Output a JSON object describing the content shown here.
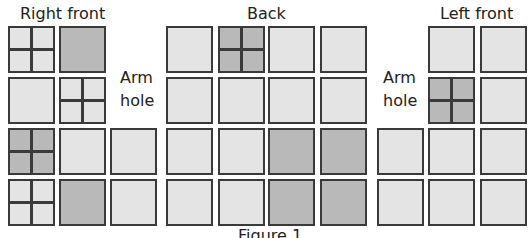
{
  "figure": {
    "caption": "Figure 1",
    "colors": {
      "light": "#e4e4e4",
      "dark": "#b9b9b9",
      "border": "#3a3a3a"
    }
  },
  "sections": {
    "right_front": {
      "title": "Right front"
    },
    "back": {
      "title": "Back"
    },
    "left_front": {
      "title": "Left front"
    }
  },
  "armhole_left": {
    "line1": "Arm",
    "line2": "hole"
  },
  "armhole_right": {
    "line1": "Arm",
    "line2": "hole"
  },
  "squares": [
    {
      "section": "right_front",
      "row": 1,
      "col": 1,
      "x": 8,
      "y": 26,
      "shade": "light",
      "quartered": true
    },
    {
      "section": "right_front",
      "row": 1,
      "col": 2,
      "x": 59,
      "y": 26,
      "shade": "dark",
      "quartered": false
    },
    {
      "section": "right_front",
      "row": 2,
      "col": 1,
      "x": 8,
      "y": 77,
      "shade": "light",
      "quartered": false
    },
    {
      "section": "right_front",
      "row": 2,
      "col": 2,
      "x": 59,
      "y": 77,
      "shade": "light",
      "quartered": true
    },
    {
      "section": "right_front",
      "row": 3,
      "col": 1,
      "x": 8,
      "y": 128,
      "shade": "dark",
      "quartered": true
    },
    {
      "section": "right_front",
      "row": 3,
      "col": 2,
      "x": 59,
      "y": 128,
      "shade": "light",
      "quartered": false
    },
    {
      "section": "right_front",
      "row": 3,
      "col": 3,
      "x": 110,
      "y": 128,
      "shade": "light",
      "quartered": false
    },
    {
      "section": "right_front",
      "row": 4,
      "col": 1,
      "x": 8,
      "y": 179,
      "shade": "light",
      "quartered": true
    },
    {
      "section": "right_front",
      "row": 4,
      "col": 2,
      "x": 59,
      "y": 179,
      "shade": "dark",
      "quartered": false
    },
    {
      "section": "right_front",
      "row": 4,
      "col": 3,
      "x": 110,
      "y": 179,
      "shade": "light",
      "quartered": false
    },
    {
      "section": "back",
      "row": 1,
      "col": 1,
      "x": 166,
      "y": 26,
      "shade": "light",
      "quartered": false
    },
    {
      "section": "back",
      "row": 1,
      "col": 2,
      "x": 218,
      "y": 26,
      "shade": "dark",
      "quartered": true
    },
    {
      "section": "back",
      "row": 1,
      "col": 3,
      "x": 268,
      "y": 26,
      "shade": "light",
      "quartered": false
    },
    {
      "section": "back",
      "row": 1,
      "col": 4,
      "x": 320,
      "y": 26,
      "shade": "light",
      "quartered": false
    },
    {
      "section": "back",
      "row": 2,
      "col": 1,
      "x": 166,
      "y": 77,
      "shade": "light",
      "quartered": false
    },
    {
      "section": "back",
      "row": 2,
      "col": 2,
      "x": 218,
      "y": 77,
      "shade": "light",
      "quartered": false
    },
    {
      "section": "back",
      "row": 2,
      "col": 3,
      "x": 268,
      "y": 77,
      "shade": "light",
      "quartered": false
    },
    {
      "section": "back",
      "row": 2,
      "col": 4,
      "x": 320,
      "y": 77,
      "shade": "light",
      "quartered": false
    },
    {
      "section": "back",
      "row": 3,
      "col": 1,
      "x": 166,
      "y": 128,
      "shade": "light",
      "quartered": false
    },
    {
      "section": "back",
      "row": 3,
      "col": 2,
      "x": 218,
      "y": 128,
      "shade": "light",
      "quartered": false
    },
    {
      "section": "back",
      "row": 3,
      "col": 3,
      "x": 268,
      "y": 128,
      "shade": "dark",
      "quartered": false
    },
    {
      "section": "back",
      "row": 3,
      "col": 4,
      "x": 320,
      "y": 128,
      "shade": "dark",
      "quartered": false
    },
    {
      "section": "back",
      "row": 4,
      "col": 1,
      "x": 166,
      "y": 179,
      "shade": "light",
      "quartered": false
    },
    {
      "section": "back",
      "row": 4,
      "col": 2,
      "x": 218,
      "y": 179,
      "shade": "light",
      "quartered": false
    },
    {
      "section": "back",
      "row": 4,
      "col": 3,
      "x": 268,
      "y": 179,
      "shade": "dark",
      "quartered": false
    },
    {
      "section": "back",
      "row": 4,
      "col": 4,
      "x": 320,
      "y": 179,
      "shade": "dark",
      "quartered": false
    },
    {
      "section": "left_front",
      "row": 1,
      "col": 2,
      "x": 428,
      "y": 26,
      "shade": "light",
      "quartered": false
    },
    {
      "section": "left_front",
      "row": 1,
      "col": 3,
      "x": 480,
      "y": 26,
      "shade": "light",
      "quartered": false
    },
    {
      "section": "left_front",
      "row": 2,
      "col": 2,
      "x": 428,
      "y": 77,
      "shade": "dark",
      "quartered": true
    },
    {
      "section": "left_front",
      "row": 2,
      "col": 3,
      "x": 480,
      "y": 77,
      "shade": "light",
      "quartered": false
    },
    {
      "section": "left_front",
      "row": 3,
      "col": 1,
      "x": 377,
      "y": 128,
      "shade": "light",
      "quartered": false
    },
    {
      "section": "left_front",
      "row": 3,
      "col": 2,
      "x": 428,
      "y": 128,
      "shade": "light",
      "quartered": false
    },
    {
      "section": "left_front",
      "row": 3,
      "col": 3,
      "x": 480,
      "y": 128,
      "shade": "light",
      "quartered": false
    },
    {
      "section": "left_front",
      "row": 4,
      "col": 1,
      "x": 377,
      "y": 179,
      "shade": "light",
      "quartered": false
    },
    {
      "section": "left_front",
      "row": 4,
      "col": 2,
      "x": 428,
      "y": 179,
      "shade": "light",
      "quartered": false
    },
    {
      "section": "left_front",
      "row": 4,
      "col": 3,
      "x": 480,
      "y": 179,
      "shade": "light",
      "quartered": false
    }
  ]
}
